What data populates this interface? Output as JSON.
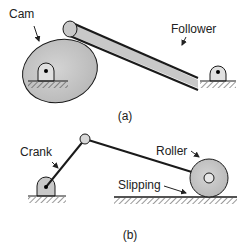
{
  "figure_a": {
    "caption": "(a)",
    "labels": {
      "cam": "Cam",
      "follower": "Follower"
    }
  },
  "figure_b": {
    "caption": "(b)",
    "labels": {
      "crank": "Crank",
      "roller": "Roller",
      "slipping": "Slipping"
    }
  },
  "colors": {
    "fill_gray": "#c8c8c8",
    "stroke": "#1a1a1a",
    "text": "#222222"
  }
}
